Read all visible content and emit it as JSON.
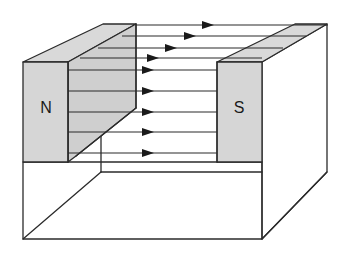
{
  "diagram": {
    "colors": {
      "magnet_fill": "#d6d6d6",
      "stroke": "#2b2b2b",
      "background": "#ffffff"
    },
    "magnets": [
      {
        "id": "north",
        "label": "N",
        "label_pos": [
          46,
          107
        ]
      },
      {
        "id": "south",
        "label": "S",
        "label_pos": [
          239,
          107
        ]
      }
    ],
    "field_lines": [
      {
        "y": 25,
        "x1": 136,
        "x2": 328,
        "arrow_x": 208
      },
      {
        "y": 36,
        "x1": 122,
        "x2": 306,
        "arrow_x": 190
      },
      {
        "y": 48,
        "x1": 98,
        "x2": 283,
        "arrow_x": 171
      },
      {
        "y": 58,
        "x1": 80,
        "x2": 262,
        "arrow_x": 153
      },
      {
        "y": 70,
        "x1": 68,
        "x2": 217,
        "arrow_x": 148
      },
      {
        "y": 91,
        "x1": 68,
        "x2": 217,
        "arrow_x": 148
      },
      {
        "y": 112,
        "x1": 68,
        "x2": 217,
        "arrow_x": 148
      },
      {
        "y": 132,
        "x1": 68,
        "x2": 217,
        "arrow_x": 148
      },
      {
        "y": 153,
        "x1": 68,
        "x2": 217,
        "arrow_x": 148
      }
    ]
  }
}
